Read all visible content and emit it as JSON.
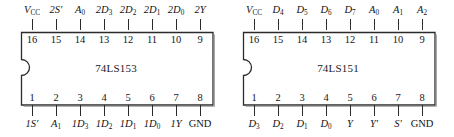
{
  "figure": {
    "type": "ic-pinout-diagram",
    "chip_count": 2,
    "style": {
      "outline_color": "#2b2b2b",
      "text_color": "#141414",
      "background": "#ffffff"
    }
  },
  "chips": [
    {
      "id": "chip-74ls153",
      "part_number": "74LS153",
      "package": "DIP-16",
      "notch": "left-center-semicircle",
      "top_pins": [
        {
          "number": "16",
          "label": {
            "base": "V",
            "sub": "CC",
            "prime": false,
            "italic": true
          }
        },
        {
          "number": "15",
          "label": {
            "base": "2S",
            "sub": "",
            "prime": true,
            "italic": true
          }
        },
        {
          "number": "14",
          "label": {
            "base": "A",
            "sub": "0",
            "prime": false,
            "italic": true
          }
        },
        {
          "number": "13",
          "label": {
            "base": "2D",
            "sub": "3",
            "prime": false,
            "italic": true
          }
        },
        {
          "number": "12",
          "label": {
            "base": "2D",
            "sub": "2",
            "prime": false,
            "italic": true
          }
        },
        {
          "number": "11",
          "label": {
            "base": "2D",
            "sub": "1",
            "prime": false,
            "italic": true
          }
        },
        {
          "number": "10",
          "label": {
            "base": "2D",
            "sub": "0",
            "prime": false,
            "italic": true
          }
        },
        {
          "number": "9",
          "label": {
            "base": "2Y",
            "sub": "",
            "prime": false,
            "italic": true
          }
        }
      ],
      "bottom_pins": [
        {
          "number": "1",
          "label": {
            "base": "1S",
            "sub": "",
            "prime": true,
            "italic": true
          }
        },
        {
          "number": "2",
          "label": {
            "base": "A",
            "sub": "1",
            "prime": false,
            "italic": true
          }
        },
        {
          "number": "3",
          "label": {
            "base": "1D",
            "sub": "3",
            "prime": false,
            "italic": true
          }
        },
        {
          "number": "4",
          "label": {
            "base": "1D",
            "sub": "2",
            "prime": false,
            "italic": true
          }
        },
        {
          "number": "5",
          "label": {
            "base": "1D",
            "sub": "1",
            "prime": false,
            "italic": true
          }
        },
        {
          "number": "6",
          "label": {
            "base": "1D",
            "sub": "0",
            "prime": false,
            "italic": true
          }
        },
        {
          "number": "7",
          "label": {
            "base": "1Y",
            "sub": "",
            "prime": false,
            "italic": true
          }
        },
        {
          "number": "8",
          "label": {
            "base": "GND",
            "sub": "",
            "prime": false,
            "italic": false
          }
        }
      ]
    },
    {
      "id": "chip-74ls151",
      "part_number": "74LS151",
      "package": "DIP-16",
      "notch": "left-center-semicircle",
      "top_pins": [
        {
          "number": "16",
          "label": {
            "base": "V",
            "sub": "CC",
            "prime": false,
            "italic": true
          }
        },
        {
          "number": "15",
          "label": {
            "base": "D",
            "sub": "4",
            "prime": false,
            "italic": true
          }
        },
        {
          "number": "14",
          "label": {
            "base": "D",
            "sub": "5",
            "prime": false,
            "italic": true
          }
        },
        {
          "number": "13",
          "label": {
            "base": "D",
            "sub": "6",
            "prime": false,
            "italic": true
          }
        },
        {
          "number": "12",
          "label": {
            "base": "D",
            "sub": "7",
            "prime": false,
            "italic": true
          }
        },
        {
          "number": "11",
          "label": {
            "base": "A",
            "sub": "0",
            "prime": false,
            "italic": true
          }
        },
        {
          "number": "10",
          "label": {
            "base": "A",
            "sub": "1",
            "prime": false,
            "italic": true
          }
        },
        {
          "number": "9",
          "label": {
            "base": "A",
            "sub": "2",
            "prime": false,
            "italic": true
          }
        }
      ],
      "bottom_pins": [
        {
          "number": "1",
          "label": {
            "base": "D",
            "sub": "3",
            "prime": false,
            "italic": true
          }
        },
        {
          "number": "2",
          "label": {
            "base": "D",
            "sub": "2",
            "prime": false,
            "italic": true
          }
        },
        {
          "number": "3",
          "label": {
            "base": "D",
            "sub": "1",
            "prime": false,
            "italic": true
          }
        },
        {
          "number": "4",
          "label": {
            "base": "D",
            "sub": "0",
            "prime": false,
            "italic": true
          }
        },
        {
          "number": "5",
          "label": {
            "base": "Y",
            "sub": "",
            "prime": false,
            "italic": true
          }
        },
        {
          "number": "6",
          "label": {
            "base": "Y",
            "sub": "",
            "prime": true,
            "italic": true
          }
        },
        {
          "number": "7",
          "label": {
            "base": "S",
            "sub": "",
            "prime": true,
            "italic": true
          }
        },
        {
          "number": "8",
          "label": {
            "base": "GND",
            "sub": "",
            "prime": false,
            "italic": false
          }
        }
      ]
    }
  ]
}
